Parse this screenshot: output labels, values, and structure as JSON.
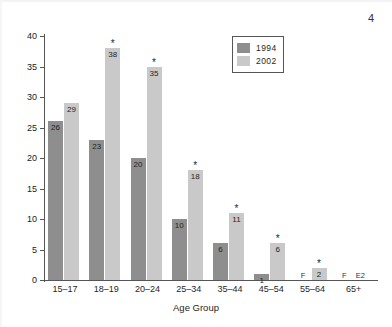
{
  "page": {
    "number": "4"
  },
  "chart_data": {
    "type": "bar",
    "title": "",
    "xlabel": "Age Group",
    "ylabel": "",
    "ylim": [
      0,
      40
    ],
    "yticks": [
      "0",
      "5",
      "10",
      "15",
      "20",
      "25",
      "30",
      "35",
      "40"
    ],
    "grid": false,
    "legend_position": "top-right",
    "categories": [
      "15–17",
      "18–19",
      "20–24",
      "25–34",
      "35–44",
      "45–54",
      "55–64",
      "65+"
    ],
    "series": [
      {
        "name": "1994",
        "color": "#8e8e8e",
        "values": [
          26,
          23,
          20,
          10,
          6,
          1,
          null,
          null
        ],
        "labels": [
          "26",
          "23",
          "20",
          "10",
          "6",
          "1",
          "F",
          "F"
        ],
        "significance": [
          "",
          "",
          "",
          "",
          "",
          "",
          "",
          ""
        ]
      },
      {
        "name": "2002",
        "color": "#c9c9c9",
        "values": [
          29,
          38,
          35,
          18,
          11,
          6,
          2,
          null
        ],
        "labels": [
          "29",
          "38",
          "35",
          "18",
          "11",
          "6",
          "2",
          "E2"
        ],
        "significance": [
          "",
          "*",
          "*",
          "*",
          "*",
          "*",
          "*",
          ""
        ]
      }
    ],
    "annotations": {
      "asterisk_meaning": "*",
      "suppressed_marker": "F",
      "estimate_marker": "E2"
    }
  },
  "legend": {
    "items": [
      {
        "label": "1994",
        "color": "#8e8e8e"
      },
      {
        "label": "2002",
        "color": "#c9c9c9"
      }
    ]
  }
}
